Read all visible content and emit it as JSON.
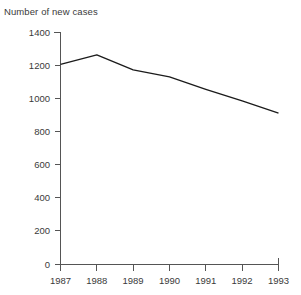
{
  "chart_data": {
    "type": "line",
    "title": "Number of new cases",
    "xlabel": "",
    "ylabel": "",
    "categories": [
      "1987",
      "1988",
      "1989",
      "1990",
      "1991",
      "1992",
      "1993"
    ],
    "x": [
      1987,
      1988,
      1989,
      1990,
      1991,
      1992,
      1993
    ],
    "values": [
      1205,
      1262,
      1172,
      1130,
      1055,
      985,
      912
    ],
    "series": [
      {
        "name": "Number of new cases",
        "values": [
          1205,
          1262,
          1172,
          1130,
          1055,
          985,
          912
        ]
      }
    ],
    "ylim": [
      0,
      1400
    ],
    "yticks": [
      0,
      200,
      400,
      600,
      800,
      1000,
      1200,
      1400
    ],
    "ytick_labels": [
      "0",
      "200",
      "400",
      "600",
      "800",
      "1000",
      "1200",
      "1400"
    ],
    "xtick_labels": [
      "1987",
      "1988",
      "1989",
      "1990",
      "1991",
      "1992",
      "1993"
    ],
    "grid": false,
    "legend": false,
    "legend_position": "none",
    "line_color": "#1b1b1b",
    "axis_color": "#555555",
    "text_color": "#3a3a3a",
    "background_color": "#ffffff",
    "annotations": []
  }
}
